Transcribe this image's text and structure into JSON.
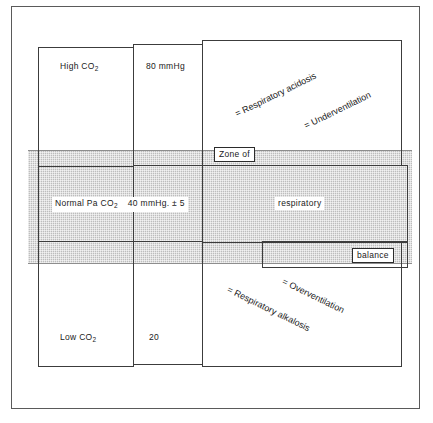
{
  "figure": {
    "title": "Zone of respiratory balance",
    "gray_band_color": "#bdbdbd",
    "line_color": "#3c3c3c",
    "frame_color": "#5a5a5a"
  },
  "columns": {
    "high_co2": "High  CO",
    "high_co2_sub": "2",
    "value_80": "80 mmHg",
    "normal_paco2": "Normal Pa CO",
    "normal_paco2_sub": "2",
    "normal_value": "40 mmHg. ± 5",
    "low_co2": "Low  CO",
    "low_co2_sub": "2",
    "value_20": "20"
  },
  "band_labels": {
    "zone_of": "Zone of",
    "respiratory": "respiratory",
    "balance": "balance"
  },
  "annotations": {
    "respiratory_acidosis": "= Respiratory acidosis",
    "underventilation": "= Underventilation",
    "respiratory_alkalosis": "= Respiratory alkalosis",
    "overventilation": "= Overventilation"
  }
}
